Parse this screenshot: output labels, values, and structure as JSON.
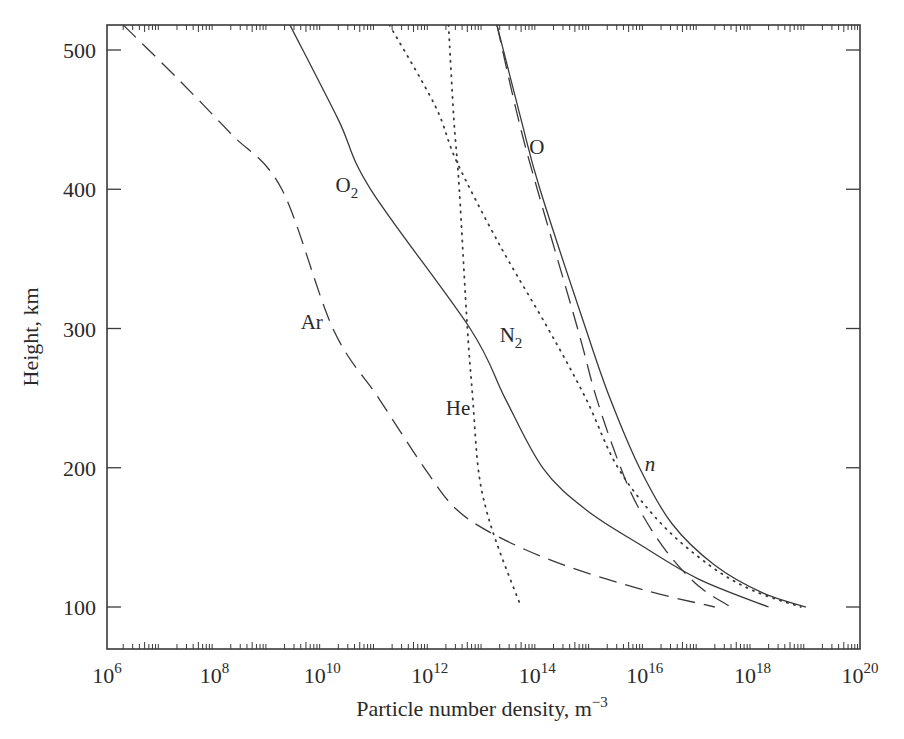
{
  "chart_data": {
    "type": "line",
    "title": "",
    "xlabel": "Particle number density, m⁻³",
    "xlabel_base": "Particle number density, m",
    "xlabel_exp": "−3",
    "ylabel": "Height, km",
    "xscale": "log",
    "xlim": [
      1000000.0,
      1e+20
    ],
    "ylim": [
      70,
      520
    ],
    "grid": false,
    "legend": "inline curve labels",
    "x_ticks": [
      {
        "base": "10",
        "exp": "6",
        "log": 6
      },
      {
        "base": "10",
        "exp": "8",
        "log": 8
      },
      {
        "base": "10",
        "exp": "10",
        "log": 10
      },
      {
        "base": "10",
        "exp": "12",
        "log": 12
      },
      {
        "base": "10",
        "exp": "14",
        "log": 14
      },
      {
        "base": "10",
        "exp": "16",
        "log": 16
      },
      {
        "base": "10",
        "exp": "18",
        "log": 18
      },
      {
        "base": "10",
        "exp": "20",
        "log": 20
      }
    ],
    "y_ticks": [
      {
        "label": "100",
        "value": 100
      },
      {
        "label": "200",
        "value": 200
      },
      {
        "label": "300",
        "value": 300
      },
      {
        "label": "400",
        "value": 400
      },
      {
        "label": "500",
        "value": 500
      }
    ],
    "series": [
      {
        "name": "Ar",
        "style": "dashed",
        "label_pos": {
          "log": 9.6,
          "height": 300
        },
        "points": [
          [
            6.3,
            518
          ],
          [
            7.3,
            480
          ],
          [
            8.3,
            440
          ],
          [
            9.25,
            400
          ],
          [
            10.2,
            300
          ],
          [
            11.05,
            250
          ],
          [
            11.9,
            200
          ],
          [
            12.5,
            170
          ],
          [
            13.3,
            150
          ],
          [
            14.5,
            130
          ],
          [
            16.0,
            112
          ],
          [
            17.3,
            100
          ]
        ]
      },
      {
        "name": "O2",
        "label": "O",
        "label_sub": "2",
        "style": "solid",
        "label_pos": {
          "log": 10.25,
          "height": 398
        },
        "points": [
          [
            9.4,
            518
          ],
          [
            10.3,
            450
          ],
          [
            10.9,
            400
          ],
          [
            12.75,
            300
          ],
          [
            13.4,
            250
          ],
          [
            14.1,
            200
          ],
          [
            14.9,
            170
          ],
          [
            15.9,
            145
          ],
          [
            17.0,
            120
          ],
          [
            18.3,
            100
          ]
        ]
      },
      {
        "name": "He",
        "style": "dotted",
        "label_pos": {
          "log": 12.3,
          "height": 238
        },
        "points": [
          [
            12.35,
            518
          ],
          [
            12.45,
            450
          ],
          [
            12.55,
            400
          ],
          [
            12.7,
            300
          ],
          [
            12.8,
            250
          ],
          [
            12.9,
            200
          ],
          [
            13.05,
            170
          ],
          [
            13.3,
            140
          ],
          [
            13.7,
            100
          ]
        ]
      },
      {
        "name": "N2",
        "label": "N",
        "label_sub": "2",
        "style": "dotted",
        "label_pos": {
          "log": 13.3,
          "height": 290
        },
        "points": [
          [
            11.25,
            518
          ],
          [
            12.1,
            460
          ],
          [
            12.5,
            420
          ],
          [
            13.3,
            360
          ],
          [
            14.2,
            300
          ],
          [
            14.9,
            250
          ],
          [
            15.5,
            200
          ],
          [
            16.3,
            160
          ],
          [
            17.2,
            130
          ],
          [
            18.0,
            112
          ],
          [
            18.9,
            100
          ]
        ]
      },
      {
        "name": "O",
        "style": "dashed",
        "label_pos": {
          "log": 13.85,
          "height": 425
        },
        "points": [
          [
            13.25,
            518
          ],
          [
            13.65,
            450
          ],
          [
            14.0,
            400
          ],
          [
            14.75,
            300
          ],
          [
            15.1,
            250
          ],
          [
            15.55,
            200
          ],
          [
            15.9,
            170
          ],
          [
            16.4,
            140
          ],
          [
            17.0,
            115
          ],
          [
            17.6,
            100
          ]
        ]
      },
      {
        "name": "n",
        "style": "solid",
        "label_pos": {
          "log": 16.0,
          "height": 198
        },
        "points": [
          [
            13.25,
            518
          ],
          [
            13.7,
            450
          ],
          [
            14.05,
            400
          ],
          [
            14.9,
            300
          ],
          [
            15.35,
            250
          ],
          [
            15.9,
            200
          ],
          [
            16.5,
            160
          ],
          [
            17.3,
            130
          ],
          [
            18.2,
            110
          ],
          [
            19.0,
            100
          ]
        ]
      }
    ]
  }
}
